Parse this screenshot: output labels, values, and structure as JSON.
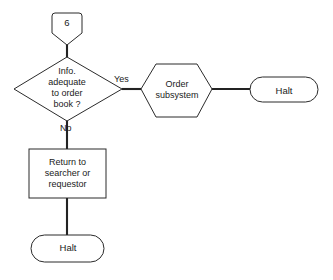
{
  "diagram": {
    "type": "flowchart",
    "background_color": "#ffffff",
    "line_color": "#232323",
    "shape_stroke_color": "#2b2b2b",
    "nodes": [
      {
        "id": "connector_6",
        "shape": "off-page-connector",
        "label": "6"
      },
      {
        "id": "decision_info_adequate",
        "shape": "diamond",
        "label": "Info.\nadequate\nto order\nbook ?"
      },
      {
        "id": "process_order_subsystem",
        "shape": "hexagon",
        "label": "Order\nsubsystem"
      },
      {
        "id": "terminal_halt_right",
        "shape": "stadium",
        "label": "Halt"
      },
      {
        "id": "process_return",
        "shape": "rectangle",
        "label": "Return to\nsearcher or\nrequestor"
      },
      {
        "id": "terminal_halt_bottom",
        "shape": "stadium",
        "label": "Halt"
      }
    ],
    "edges": [
      {
        "id": "edge_connector_to_decision",
        "from": "connector_6",
        "to": "decision_info_adequate",
        "label": ""
      },
      {
        "id": "edge_decision_yes",
        "from": "decision_info_adequate",
        "to": "process_order_subsystem",
        "label": "Yes"
      },
      {
        "id": "edge_hex_to_halt",
        "from": "process_order_subsystem",
        "to": "terminal_halt_right",
        "label": ""
      },
      {
        "id": "edge_decision_no",
        "from": "decision_info_adequate",
        "to": "process_return",
        "label": "No"
      },
      {
        "id": "edge_return_to_halt",
        "from": "process_return",
        "to": "terminal_halt_bottom",
        "label": ""
      }
    ]
  }
}
